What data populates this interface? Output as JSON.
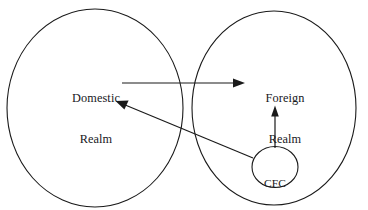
{
  "diagram": {
    "type": "venn-flow-diagram",
    "canvas": {
      "width": 368,
      "height": 210,
      "background": "#ffffff"
    },
    "stroke_color": "#1a1a1a",
    "text_color": "#17171c",
    "nodes": [
      {
        "id": "domestic-realm",
        "shape": "ellipse",
        "label_line_1": "Domestic",
        "label_line_2": "Realm",
        "cx": 95,
        "cy": 108,
        "rx": 88,
        "ry": 99
      },
      {
        "id": "foreign-realm",
        "shape": "ellipse",
        "label_line_1": "Foreign",
        "label_line_2": "Realm",
        "cx": 274,
        "cy": 108,
        "rx": 82,
        "ry": 97
      },
      {
        "id": "cfc-realm",
        "shape": "ellipse",
        "label_line_1": "CFC",
        "label_line_2": "Realm",
        "cx": 275,
        "cy": 167,
        "rx": 23,
        "ry": 20.5
      }
    ],
    "arrows": [
      {
        "id": "domestic-to-foreign",
        "from": "domestic-realm",
        "to": "foreign-realm",
        "direction": "right",
        "x1": 122,
        "y1": 83,
        "x2": 245,
        "y2": 83
      },
      {
        "id": "cfc-to-domestic",
        "from": "cfc-realm",
        "to": "domestic-realm",
        "direction": "upper-left",
        "x1": 253,
        "y1": 158,
        "x2": 116,
        "y2": 101
      },
      {
        "id": "cfc-to-foreign",
        "from": "cfc-realm",
        "to": "foreign-realm",
        "direction": "up",
        "x1": 275,
        "y1": 148,
        "x2": 275,
        "y2": 106
      }
    ]
  }
}
